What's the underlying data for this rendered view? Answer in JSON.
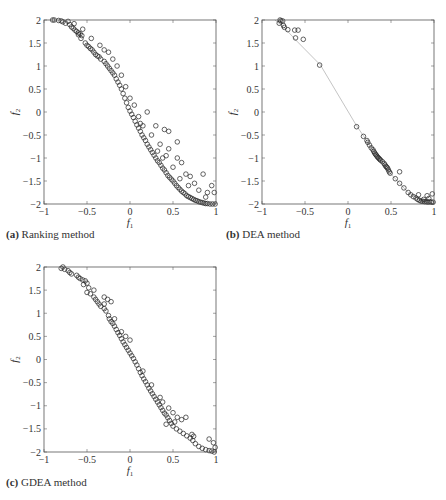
{
  "figure": {
    "panels": [
      {
        "id": "a",
        "caption_tag": "(a)",
        "caption_text": " Ranking method"
      },
      {
        "id": "b",
        "caption_tag": "(b)",
        "caption_text": " DEA method"
      },
      {
        "id": "c",
        "caption_tag": "(c)",
        "caption_text": " GDEA method"
      }
    ]
  },
  "chart_data": [
    {
      "type": "scatter",
      "title": "(a) Ranking method",
      "xlabel": "f1",
      "ylabel": "f2",
      "xlim": [
        -1,
        1
      ],
      "ylim": [
        -2,
        2
      ],
      "xticks": [
        -1,
        -0.5,
        0,
        0.5,
        1
      ],
      "yticks": [
        -2,
        -1.5,
        -1,
        -0.5,
        0,
        0.5,
        1,
        1.5,
        2
      ],
      "grid": false,
      "marker": "open-circle",
      "points": [
        [
          -0.9,
          2.0
        ],
        [
          -0.88,
          2.0
        ],
        [
          -0.83,
          1.99
        ],
        [
          -0.8,
          1.98
        ],
        [
          -0.78,
          1.96
        ],
        [
          -0.75,
          1.93
        ],
        [
          -0.72,
          1.97
        ],
        [
          -0.7,
          1.9
        ],
        [
          -0.68,
          1.85
        ],
        [
          -0.66,
          1.82
        ],
        [
          -0.64,
          1.78
        ],
        [
          -0.62,
          1.75
        ],
        [
          -0.6,
          1.72
        ],
        [
          -0.58,
          1.7
        ],
        [
          -0.56,
          1.66
        ],
        [
          -0.6,
          1.68
        ],
        [
          -0.57,
          1.6
        ],
        [
          -0.52,
          1.5
        ],
        [
          -0.5,
          1.45
        ],
        [
          -0.48,
          1.42
        ],
        [
          -0.46,
          1.38
        ],
        [
          -0.44,
          1.35
        ],
        [
          -0.42,
          1.3
        ],
        [
          -0.4,
          1.25
        ],
        [
          -0.38,
          1.22
        ],
        [
          -0.36,
          1.2
        ],
        [
          -0.34,
          1.15
        ],
        [
          -0.3,
          1.1
        ],
        [
          -0.28,
          1.05
        ],
        [
          -0.26,
          1.0
        ],
        [
          -0.24,
          0.95
        ],
        [
          -0.22,
          0.9
        ],
        [
          -0.2,
          0.85
        ],
        [
          -0.18,
          0.8
        ],
        [
          -0.16,
          0.72
        ],
        [
          -0.14,
          0.65
        ],
        [
          -0.12,
          0.58
        ],
        [
          -0.1,
          0.5
        ],
        [
          -0.08,
          0.4
        ],
        [
          -0.06,
          0.3
        ],
        [
          -0.04,
          0.2
        ],
        [
          -0.02,
          0.1
        ],
        [
          0.0,
          0.02
        ],
        [
          0.02,
          -0.05
        ],
        [
          0.04,
          -0.12
        ],
        [
          0.06,
          -0.2
        ],
        [
          0.08,
          -0.28
        ],
        [
          0.1,
          -0.35
        ],
        [
          0.12,
          -0.42
        ],
        [
          0.14,
          -0.5
        ],
        [
          0.16,
          -0.56
        ],
        [
          0.18,
          -0.62
        ],
        [
          0.2,
          -0.7
        ],
        [
          0.22,
          -0.76
        ],
        [
          0.24,
          -0.82
        ],
        [
          0.26,
          -0.88
        ],
        [
          0.28,
          -0.94
        ],
        [
          0.3,
          -1.0
        ],
        [
          0.32,
          -1.06
        ],
        [
          0.34,
          -1.1
        ],
        [
          0.36,
          -1.16
        ],
        [
          0.38,
          -1.22
        ],
        [
          0.4,
          -1.26
        ],
        [
          0.42,
          -1.32
        ],
        [
          0.44,
          -1.38
        ],
        [
          0.46,
          -1.42
        ],
        [
          0.48,
          -1.46
        ],
        [
          0.5,
          -1.5
        ],
        [
          0.52,
          -1.55
        ],
        [
          0.54,
          -1.6
        ],
        [
          0.56,
          -1.64
        ],
        [
          0.58,
          -1.68
        ],
        [
          0.6,
          -1.72
        ],
        [
          0.62,
          -1.75
        ],
        [
          0.64,
          -1.78
        ],
        [
          0.66,
          -1.82
        ],
        [
          0.68,
          -1.84
        ],
        [
          0.7,
          -1.86
        ],
        [
          0.72,
          -1.88
        ],
        [
          0.74,
          -1.9
        ],
        [
          0.76,
          -1.92
        ],
        [
          0.78,
          -1.93
        ],
        [
          0.8,
          -1.95
        ],
        [
          0.82,
          -1.96
        ],
        [
          0.84,
          -1.97
        ],
        [
          0.86,
          -1.98
        ],
        [
          0.88,
          -1.99
        ],
        [
          0.9,
          -1.99
        ],
        [
          0.93,
          -2.0
        ],
        [
          0.96,
          -2.0
        ],
        [
          0.99,
          -2.0
        ],
        [
          -0.3,
          1.35
        ],
        [
          -0.25,
          1.3
        ],
        [
          -0.2,
          1.15
        ],
        [
          -0.15,
          1.0
        ],
        [
          -0.1,
          0.8
        ],
        [
          -0.05,
          0.55
        ],
        [
          0.0,
          0.3
        ],
        [
          0.05,
          0.15
        ],
        [
          0.2,
          0.0
        ],
        [
          0.3,
          -0.3
        ],
        [
          0.4,
          -0.38
        ],
        [
          0.45,
          -0.42
        ],
        [
          0.55,
          -0.65
        ],
        [
          0.45,
          -0.8
        ],
        [
          0.55,
          -1.0
        ],
        [
          0.6,
          -1.1
        ],
        [
          0.65,
          -1.35
        ],
        [
          0.7,
          -1.4
        ],
        [
          0.75,
          -1.55
        ],
        [
          0.85,
          -1.35
        ],
        [
          0.8,
          -1.7
        ],
        [
          0.9,
          -1.75
        ],
        [
          0.95,
          -1.6
        ],
        [
          0.98,
          -1.75
        ],
        [
          0.35,
          -0.7
        ],
        [
          0.25,
          -0.5
        ],
        [
          0.15,
          -0.3
        ],
        [
          0.42,
          -0.95
        ],
        [
          0.5,
          -1.2
        ],
        [
          -0.45,
          1.6
        ],
        [
          -0.35,
          1.45
        ],
        [
          -0.55,
          1.8
        ],
        [
          -0.65,
          1.92
        ],
        [
          0.1,
          -0.1
        ],
        [
          0.12,
          -0.25
        ],
        [
          0.32,
          -0.85
        ],
        [
          0.38,
          -1.0
        ],
        [
          0.58,
          -1.45
        ],
        [
          0.68,
          -1.6
        ],
        [
          0.88,
          -1.85
        ]
      ]
    },
    {
      "type": "scatter",
      "title": "(b) DEA method",
      "xlabel": "f1",
      "ylabel": "f2",
      "xlim": [
        -1,
        1
      ],
      "ylim": [
        -2,
        2
      ],
      "xticks": [
        -1,
        -0.5,
        0,
        0.5,
        1
      ],
      "yticks": [
        -2,
        -1.5,
        -1,
        -0.5,
        0,
        0.5,
        1,
        1.5,
        2
      ],
      "grid": false,
      "marker": "open-circle",
      "line": [
        [
          -0.85,
          2.0
        ],
        [
          -0.75,
          1.85
        ],
        [
          -0.6,
          1.55
        ],
        [
          -0.32,
          1.02
        ],
        [
          0.1,
          -0.3
        ],
        [
          0.3,
          -0.85
        ],
        [
          0.5,
          -1.35
        ],
        [
          0.7,
          -1.75
        ],
        [
          0.85,
          -1.92
        ],
        [
          1.0,
          -2.0
        ]
      ],
      "points": [
        [
          -0.79,
          2.0
        ],
        [
          -0.78,
          1.98
        ],
        [
          -0.76,
          1.98
        ],
        [
          -0.8,
          1.93
        ],
        [
          -0.75,
          1.88
        ],
        [
          -0.74,
          1.84
        ],
        [
          -0.7,
          1.79
        ],
        [
          -0.62,
          1.78
        ],
        [
          -0.58,
          1.78
        ],
        [
          -0.61,
          1.61
        ],
        [
          -0.52,
          1.58
        ],
        [
          -0.33,
          1.02
        ],
        [
          0.1,
          -0.32
        ],
        [
          0.18,
          -0.53
        ],
        [
          0.22,
          -0.62
        ],
        [
          0.23,
          -0.66
        ],
        [
          0.25,
          -0.72
        ],
        [
          0.27,
          -0.78
        ],
        [
          0.29,
          -0.82
        ],
        [
          0.3,
          -0.86
        ],
        [
          0.31,
          -0.89
        ],
        [
          0.32,
          -0.92
        ],
        [
          0.33,
          -0.94
        ],
        [
          0.34,
          -0.97
        ],
        [
          0.35,
          -0.99
        ],
        [
          0.36,
          -1.01
        ],
        [
          0.37,
          -1.03
        ],
        [
          0.38,
          -1.05
        ],
        [
          0.4,
          -1.08
        ],
        [
          0.42,
          -1.12
        ],
        [
          0.43,
          -1.15
        ],
        [
          0.44,
          -1.18
        ],
        [
          0.46,
          -1.22
        ],
        [
          0.47,
          -1.26
        ],
        [
          0.48,
          -1.3
        ],
        [
          0.45,
          -1.2
        ],
        [
          0.49,
          -1.33
        ],
        [
          0.55,
          -1.45
        ],
        [
          0.6,
          -1.3
        ],
        [
          0.6,
          -1.55
        ],
        [
          0.65,
          -1.65
        ],
        [
          0.7,
          -1.75
        ],
        [
          0.73,
          -1.8
        ],
        [
          0.76,
          -1.84
        ],
        [
          0.79,
          -1.87
        ],
        [
          0.81,
          -1.9
        ],
        [
          0.83,
          -1.92
        ],
        [
          0.85,
          -1.94
        ],
        [
          0.87,
          -1.94
        ],
        [
          0.89,
          -1.95
        ],
        [
          0.91,
          -1.95
        ],
        [
          0.93,
          -1.96
        ],
        [
          0.95,
          -1.95
        ],
        [
          0.97,
          -1.96
        ],
        [
          0.99,
          -1.96
        ],
        [
          0.82,
          -1.8
        ],
        [
          0.92,
          -1.82
        ],
        [
          0.98,
          -1.78
        ],
        [
          0.94,
          -1.88
        ],
        [
          0.88,
          -1.9
        ]
      ]
    },
    {
      "type": "scatter",
      "title": "(c) GDEA method",
      "xlabel": "f1",
      "ylabel": "f2",
      "xlim": [
        -1,
        1
      ],
      "ylim": [
        -2,
        2
      ],
      "xticks": [
        -1,
        -0.5,
        0,
        0.5,
        1
      ],
      "yticks": [
        -2,
        -1.5,
        -1,
        -0.5,
        0,
        0.5,
        1,
        1.5,
        2
      ],
      "grid": false,
      "marker": "open-circle",
      "points": [
        [
          -0.78,
          2.0
        ],
        [
          -0.8,
          1.97
        ],
        [
          -0.76,
          1.95
        ],
        [
          -0.72,
          1.92
        ],
        [
          -0.7,
          1.88
        ],
        [
          -0.68,
          1.85
        ],
        [
          -0.6,
          1.78
        ],
        [
          -0.58,
          1.75
        ],
        [
          -0.55,
          1.72
        ],
        [
          -0.52,
          1.7
        ],
        [
          -0.5,
          1.65
        ],
        [
          -0.54,
          1.62
        ],
        [
          -0.48,
          1.55
        ],
        [
          -0.5,
          1.45
        ],
        [
          -0.46,
          1.42
        ],
        [
          -0.42,
          1.35
        ],
        [
          -0.4,
          1.3
        ],
        [
          -0.38,
          1.25
        ],
        [
          -0.36,
          1.2
        ],
        [
          -0.34,
          1.15
        ],
        [
          -0.3,
          1.1
        ],
        [
          -0.28,
          1.05
        ],
        [
          -0.25,
          0.95
        ],
        [
          -0.24,
          0.88
        ],
        [
          -0.22,
          0.82
        ],
        [
          -0.2,
          0.78
        ],
        [
          -0.18,
          0.72
        ],
        [
          -0.16,
          0.65
        ],
        [
          -0.14,
          0.58
        ],
        [
          -0.12,
          0.52
        ],
        [
          -0.1,
          0.45
        ],
        [
          -0.08,
          0.38
        ],
        [
          -0.06,
          0.32
        ],
        [
          -0.04,
          0.26
        ],
        [
          -0.02,
          0.2
        ],
        [
          0.0,
          0.14
        ],
        [
          0.02,
          0.08
        ],
        [
          0.04,
          0.02
        ],
        [
          0.06,
          -0.05
        ],
        [
          0.08,
          -0.12
        ],
        [
          0.1,
          -0.2
        ],
        [
          0.12,
          -0.28
        ],
        [
          0.14,
          -0.35
        ],
        [
          0.16,
          -0.42
        ],
        [
          0.18,
          -0.48
        ],
        [
          0.2,
          -0.55
        ],
        [
          0.22,
          -0.62
        ],
        [
          0.24,
          -0.68
        ],
        [
          0.26,
          -0.74
        ],
        [
          0.28,
          -0.8
        ],
        [
          0.3,
          -0.86
        ],
        [
          0.32,
          -0.92
        ],
        [
          0.34,
          -0.98
        ],
        [
          0.36,
          -1.04
        ],
        [
          0.38,
          -1.1
        ],
        [
          0.4,
          -1.16
        ],
        [
          0.42,
          -1.2
        ],
        [
          0.44,
          -1.26
        ],
        [
          0.46,
          -1.32
        ],
        [
          0.48,
          -1.38
        ],
        [
          0.5,
          -1.44
        ],
        [
          0.54,
          -1.5
        ],
        [
          0.58,
          -1.55
        ],
        [
          0.62,
          -1.6
        ],
        [
          0.66,
          -1.65
        ],
        [
          0.7,
          -1.7
        ],
        [
          0.72,
          -1.62
        ],
        [
          0.74,
          -1.66
        ],
        [
          0.73,
          -1.75
        ],
        [
          0.76,
          -1.82
        ],
        [
          0.8,
          -1.88
        ],
        [
          0.84,
          -1.92
        ],
        [
          0.88,
          -1.95
        ],
        [
          0.92,
          -1.97
        ],
        [
          0.95,
          -1.98
        ],
        [
          0.98,
          -2.0
        ],
        [
          0.92,
          -1.72
        ],
        [
          0.97,
          -1.8
        ],
        [
          0.99,
          -1.9
        ],
        [
          -0.3,
          1.35
        ],
        [
          -0.26,
          1.3
        ],
        [
          -0.22,
          1.25
        ],
        [
          -0.3,
          1.2
        ],
        [
          -0.05,
          0.5
        ],
        [
          0.0,
          0.42
        ],
        [
          -0.1,
          0.6
        ],
        [
          0.35,
          -0.82
        ],
        [
          0.38,
          -0.92
        ],
        [
          0.45,
          -1.05
        ],
        [
          0.5,
          -1.15
        ],
        [
          0.55,
          -1.25
        ],
        [
          0.6,
          -1.3
        ],
        [
          0.65,
          -1.25
        ],
        [
          -0.42,
          1.5
        ],
        [
          -0.62,
          1.82
        ],
        [
          0.15,
          -0.25
        ],
        [
          0.25,
          -0.55
        ],
        [
          -0.18,
          0.88
        ],
        [
          0.42,
          -1.4
        ],
        [
          0.52,
          -1.35
        ]
      ]
    }
  ]
}
